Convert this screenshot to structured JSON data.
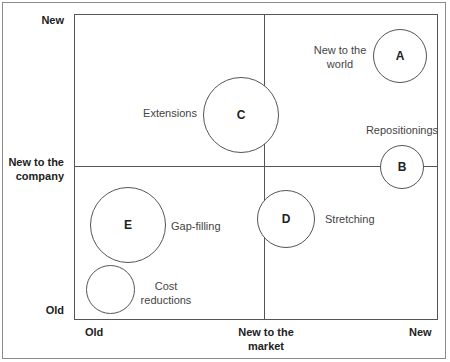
{
  "diagram": {
    "title": "",
    "y_axis": {
      "top_label": "New",
      "middle_label_line1": "New to the",
      "middle_label_line2": "company",
      "bottom_label": "Old"
    },
    "x_axis": {
      "left_label": "Old",
      "middle_label_line1": "New to the",
      "middle_label_line2": "market",
      "right_label": "New"
    },
    "items": [
      {
        "letter": "A",
        "label_line1": "New to the",
        "label_line2": "world"
      },
      {
        "letter": "B",
        "label_line1": "Repositionings",
        "label_line2": ""
      },
      {
        "letter": "C",
        "label_line1": "Extensions",
        "label_line2": ""
      },
      {
        "letter": "D",
        "label_line1": "Stretching",
        "label_line2": ""
      },
      {
        "letter": "E",
        "label_line1": "Gap-filling",
        "label_line2": ""
      },
      {
        "letter": "",
        "label_line1": "Cost",
        "label_line2": "reductions"
      }
    ]
  },
  "colors": {
    "line": "#555555",
    "frame": "#8a8a8a",
    "text": "#444444",
    "background": "#ffffff"
  }
}
